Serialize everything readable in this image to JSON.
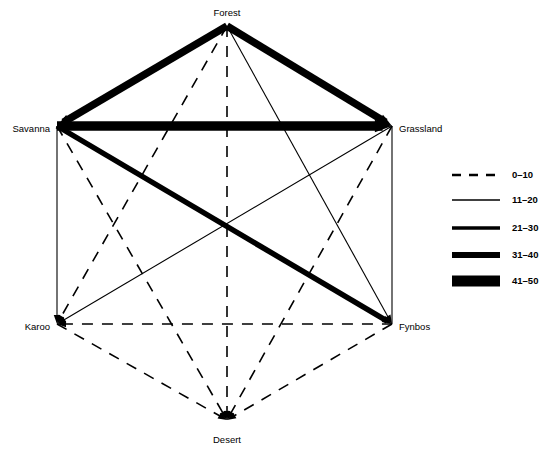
{
  "diagram": {
    "type": "network-graph",
    "title": "",
    "nodes": [
      {
        "id": "forest",
        "label": "Forest",
        "x": 227,
        "y": 26,
        "label_x": 227,
        "label_y": 13,
        "label_anchor": "middle"
      },
      {
        "id": "savanna",
        "label": "Savanna",
        "x": 57,
        "y": 126,
        "label_x": 50,
        "label_y": 129,
        "label_anchor": "end"
      },
      {
        "id": "grassland",
        "label": "Grassland",
        "x": 392,
        "y": 126,
        "label_x": 399,
        "label_y": 129,
        "label_anchor": "start"
      },
      {
        "id": "karoo",
        "label": "Karoo",
        "x": 57,
        "y": 324,
        "label_x": 50,
        "label_y": 327,
        "label_anchor": "end"
      },
      {
        "id": "fynbos",
        "label": "Fynbos",
        "x": 392,
        "y": 324,
        "label_x": 399,
        "label_y": 327,
        "label_anchor": "start"
      },
      {
        "id": "desert",
        "label": "Desert",
        "x": 227,
        "y": 420,
        "label_x": 227,
        "label_y": 440,
        "label_anchor": "middle"
      }
    ],
    "edges": [
      {
        "from": "forest",
        "to": "savanna",
        "class": "31-40",
        "width": 7.5,
        "dash": "none",
        "arrow": "end"
      },
      {
        "from": "forest",
        "to": "grassland",
        "class": "31-40",
        "width": 7.5,
        "dash": "none",
        "arrow": "end"
      },
      {
        "from": "savanna",
        "to": "grassland",
        "class": "41-50",
        "width": 9.5,
        "dash": "none",
        "arrow": "end"
      },
      {
        "from": "savanna",
        "to": "fynbos",
        "class": "31-40",
        "width": 5.5,
        "dash": "none",
        "arrow": "end"
      },
      {
        "from": "grassland",
        "to": "karoo",
        "class": "11-20",
        "width": 1.1,
        "dash": "none",
        "arrow": "end"
      },
      {
        "from": "savanna",
        "to": "karoo",
        "class": "11-20",
        "width": 1.1,
        "dash": "none",
        "arrow": "end"
      },
      {
        "from": "grassland",
        "to": "fynbos",
        "class": "11-20",
        "width": 1.1,
        "dash": "none",
        "arrow": "none"
      },
      {
        "from": "forest",
        "to": "fynbos",
        "class": "11-20",
        "width": 1.1,
        "dash": "none",
        "arrow": "end"
      },
      {
        "from": "forest",
        "to": "karoo",
        "class": "0-10",
        "width": 1.6,
        "dash": "11 9",
        "arrow": "end"
      },
      {
        "from": "forest",
        "to": "desert",
        "class": "0-10",
        "width": 1.6,
        "dash": "11 9",
        "arrow": "end"
      },
      {
        "from": "savanna",
        "to": "desert",
        "class": "0-10",
        "width": 1.6,
        "dash": "11 9",
        "arrow": "end"
      },
      {
        "from": "grassland",
        "to": "desert",
        "class": "0-10",
        "width": 1.6,
        "dash": "11 9",
        "arrow": "end"
      },
      {
        "from": "karoo",
        "to": "fynbos",
        "class": "0-10",
        "width": 1.6,
        "dash": "11 9",
        "arrow": "start"
      },
      {
        "from": "karoo",
        "to": "desert",
        "class": "0-10",
        "width": 1.6,
        "dash": "11 9",
        "arrow": "end"
      },
      {
        "from": "fynbos",
        "to": "desert",
        "class": "0-10",
        "width": 1.6,
        "dash": "11 9",
        "arrow": "end"
      }
    ]
  },
  "legend": {
    "x": 452,
    "label_x": 512,
    "line_x1": 452,
    "line_x2": 500,
    "items": [
      {
        "label": "0–10",
        "y": 175,
        "width": 2.4,
        "dash": "9 8"
      },
      {
        "label": "11–20",
        "y": 200,
        "width": 1.3,
        "dash": "none"
      },
      {
        "label": "21–30",
        "y": 228,
        "width": 3.6,
        "dash": "none"
      },
      {
        "label": "31–40",
        "y": 255,
        "width": 6.2,
        "dash": "none"
      },
      {
        "label": "41–50",
        "y": 281,
        "width": 11.0,
        "dash": "none"
      }
    ]
  },
  "colors": {
    "ink": "#000000",
    "background": "#ffffff"
  }
}
